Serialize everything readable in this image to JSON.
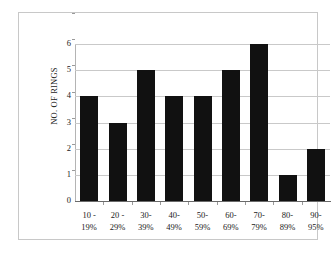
{
  "chart_data": {
    "type": "bar",
    "title": "",
    "subtitle": "",
    "xlabel": "",
    "ylabel": "NO. OF RINGS",
    "ylim": [
      0,
      6
    ],
    "ytick_labels": [
      "6",
      "5",
      "4",
      "3",
      "2",
      "1",
      "0"
    ],
    "ytick_values": [
      6,
      5,
      4,
      3,
      2,
      1,
      0
    ],
    "grid": true,
    "legend": false,
    "legend_position": "none",
    "bar_color": "#111111",
    "gridline_color": "#c9c9c9",
    "axis_color": "#6a6a6a",
    "categories": [
      "10 - 19%",
      "20 - 29%",
      "30-39%",
      "40-49%",
      "50-59%",
      "60-69%",
      "70-79%",
      "80-89%",
      "90-95%"
    ],
    "category_lines": [
      {
        "line1": "10 -",
        "line2": "19%"
      },
      {
        "line1": "20 -",
        "line2": "29%"
      },
      {
        "line1": "30-",
        "line2": "39%"
      },
      {
        "line1": "40-",
        "line2": "49%"
      },
      {
        "line1": "50-",
        "line2": "59%"
      },
      {
        "line1": "60-",
        "line2": "69%"
      },
      {
        "line1": "70-",
        "line2": "79%"
      },
      {
        "line1": "80-",
        "line2": "89%"
      },
      {
        "line1": "90-",
        "line2": "95%"
      }
    ],
    "values": [
      4,
      3,
      5,
      4,
      4,
      5,
      6,
      1,
      2
    ]
  }
}
